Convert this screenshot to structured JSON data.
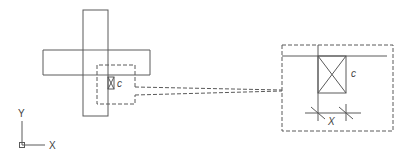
{
  "diagram": {
    "type": "cad-detail",
    "overview": {
      "vertical_bar": {
        "x": 83,
        "y": 10,
        "w": 25,
        "h": 106
      },
      "horizontal_bar": {
        "x": 43,
        "y": 50,
        "w": 107,
        "h": 25
      },
      "detail_region": {
        "x": 97,
        "y": 65,
        "w": 39,
        "h": 39
      },
      "element": {
        "x": 108,
        "y": 77,
        "w": 6,
        "h": 12,
        "label": "c"
      }
    },
    "detail_view": {
      "frame": {
        "x": 282,
        "y": 45,
        "w": 111,
        "h": 86
      },
      "element_label": "c",
      "dimension_label": "X"
    },
    "ucs": {
      "y_label": "Y",
      "x_label": "X"
    }
  }
}
